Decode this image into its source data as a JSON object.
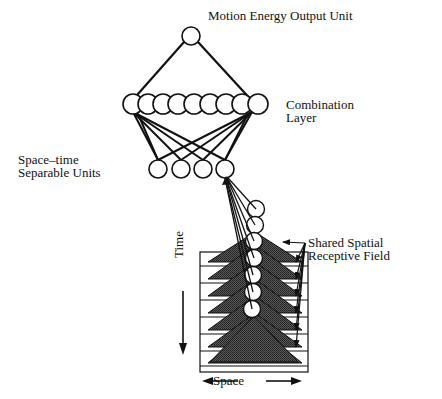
{
  "labels": {
    "output_unit": "Motion Energy Output Unit",
    "combination_layer_line1": "Combination",
    "combination_layer_line2": "Layer",
    "separable_units_line1": "Space–time",
    "separable_units_line2": "Separable Units",
    "receptive_field_line1": "Shared Spatial",
    "receptive_field_line2": "Receptive Field",
    "time_axis": "Time",
    "space_axis": "Space"
  },
  "structure": {
    "output_units": 1,
    "combination_layer_units": 9,
    "separable_units": 4,
    "temporal_stack_units": 7,
    "receptive_field_frames": 8
  },
  "colors": {
    "stroke": "#111111",
    "triangle_fill": "#4a4a4a",
    "background": "#ffffff"
  }
}
